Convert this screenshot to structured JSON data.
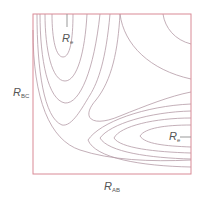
{
  "diagram": {
    "type": "potential-energy-surface-contour",
    "colors": {
      "frame": "#d98a96",
      "contour": "#b49aa6",
      "label": "#555555",
      "background": "#ffffff"
    },
    "axes": {
      "x": {
        "symbol": "R",
        "subscript": "AB"
      },
      "y": {
        "symbol": "R",
        "subscript": "BC"
      }
    },
    "markers": [
      {
        "id": "reactant-minimum",
        "symbol": "R",
        "subscript": "e",
        "region": "upper-left valley"
      },
      {
        "id": "product-minimum",
        "symbol": "R",
        "subscript": "e",
        "region": "lower-right valley"
      }
    ],
    "contour_groups": [
      {
        "region": "upper-left valley",
        "count": 4,
        "shape": "nested U opening upward"
      },
      {
        "region": "lower-right valley",
        "count": 4,
        "shape": "nested U opening rightward"
      },
      {
        "region": "saddle corner",
        "count": 1,
        "shape": "L-shaped envelope around corner"
      },
      {
        "region": "upper-right plateau",
        "count": 2,
        "shape": "concave arcs"
      }
    ]
  }
}
